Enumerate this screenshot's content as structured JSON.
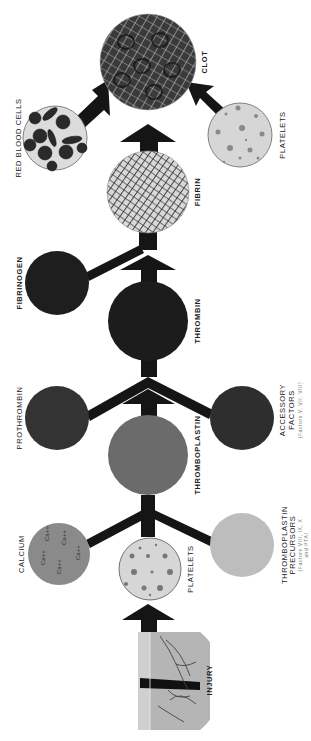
{
  "diagram": {
    "colors": {
      "background": "#ffffff",
      "arrow": "#151515",
      "clot": "#3a3a3a",
      "fibrin": "#9a9a9a",
      "thrombin": "#1c1c1c",
      "fibrinogen": "#1e1e1e",
      "prothrombin": "#333333",
      "accessory_factors": "#2e2e2e",
      "thromboplastin": "#6b6b6b",
      "calcium": "#8a8a8a",
      "platelets": "#d6d6d6",
      "thromboplastin_precursors": "#bdbdbd",
      "red_blood_cells_bg": "#dcdcdc",
      "rbc": "#2a2a2a"
    },
    "nodes": {
      "clot": {
        "label": "CLOT"
      },
      "red_blood_cells": {
        "label": "RED BLOOD CELLS"
      },
      "platelets_top": {
        "label": "PLATELETS"
      },
      "fibrin": {
        "label": "FIBRIN"
      },
      "fibrinogen": {
        "label": "FIBRINOGEN"
      },
      "thrombin": {
        "label": "THROMBIN"
      },
      "prothrombin": {
        "label": "PROTHROMBIN"
      },
      "accessory_factors": {
        "label_line1": "ACCESSORY",
        "label_line2": "FACTORS",
        "note": "(Factors V, VII, VIII)"
      },
      "thromboplastin": {
        "label": "THROMBOPLASTIN"
      },
      "calcium": {
        "label": "CALCIUM",
        "ion": "Ca++"
      },
      "platelets_bottom": {
        "label": "PLATELETS"
      },
      "thromboplastin_precursors": {
        "label_line1": "THROMBOPLASTIN",
        "label_line2": "PRECURSORS",
        "note_line1": "(Factors VIII, IX, X",
        "note_line2": "and PTA)"
      },
      "injury": {
        "label": "INJURY"
      }
    }
  }
}
